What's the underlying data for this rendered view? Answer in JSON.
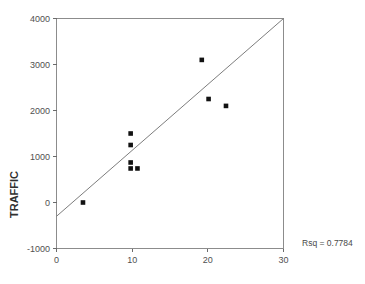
{
  "chart_data": {
    "type": "scatter",
    "title": "",
    "subtitle": "",
    "xlabel": "",
    "ylabel": "TRAFFIC",
    "xlim": [
      0,
      30
    ],
    "ylim": [
      -1000,
      4000
    ],
    "xticks": [
      0,
      10,
      20,
      30
    ],
    "xtick_labels": [
      "0",
      "10",
      "20",
      "30"
    ],
    "yticks": [
      -1000,
      0,
      1000,
      2000,
      3000,
      4000
    ],
    "ytick_labels": [
      "-1000",
      "0",
      "1000",
      "2000",
      "3000",
      "4000"
    ],
    "grid": false,
    "legend": null,
    "legend_position": "none",
    "marker_style": "filled-square",
    "marker_color": "#121212",
    "points": [
      {
        "x": 3.5,
        "y": 0
      },
      {
        "x": 9.8,
        "y": 1500
      },
      {
        "x": 9.8,
        "y": 1250
      },
      {
        "x": 9.8,
        "y": 870
      },
      {
        "x": 9.8,
        "y": 740
      },
      {
        "x": 10.7,
        "y": 740
      },
      {
        "x": 19.2,
        "y": 3100
      },
      {
        "x": 20.1,
        "y": 2250
      },
      {
        "x": 22.4,
        "y": 2100
      }
    ],
    "fit_line": {
      "type": "linear-regression",
      "x_start": 0,
      "y_start": -300,
      "x_end": 30,
      "y_end": 4000,
      "slope": 143.3,
      "intercept": -300,
      "color": "#7d7d7d"
    },
    "annotations": [
      {
        "name": "rsq-label",
        "text": "Rsq = 0.7784",
        "x": 30.5,
        "y": -1250
      }
    ],
    "rsq_value": "0.7784"
  },
  "annotation_text": {
    "rsq": "Rsq = 0.7784"
  },
  "axis": {
    "y_title": "TRAFFIC",
    "x_title": ""
  },
  "colors": {
    "marker": "#121212",
    "fit_line": "#7d7d7d",
    "frame": "#8c8c8c",
    "text": "#4a4a4a",
    "background": "#ffffff"
  }
}
